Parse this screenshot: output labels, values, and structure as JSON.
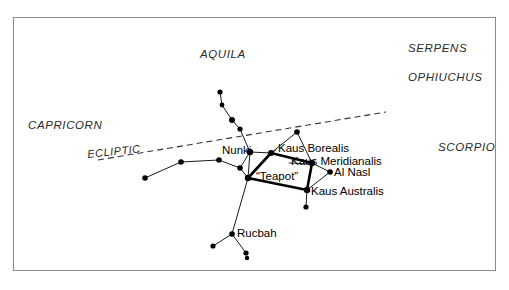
{
  "figure": {
    "background_color": "#ffffff",
    "border_color": "#8a8a8a"
  },
  "constellations": [
    {
      "name": "AQUILA",
      "x": 200,
      "y": 48
    },
    {
      "name": "SERPENS",
      "x": 408,
      "y": 42
    },
    {
      "name": "OPHIUCHUS",
      "x": 408,
      "y": 71
    },
    {
      "name": "CAPRICORN",
      "x": 28,
      "y": 119
    },
    {
      "name": "SCORPIO",
      "x": 438,
      "y": 141
    }
  ],
  "ecliptic": {
    "label": "ECLIPTIC",
    "label_x": 88,
    "label_y": 148,
    "line": {
      "x1": 98,
      "y1": 160,
      "x2": 386,
      "y2": 112
    },
    "style": "dashed",
    "color": "#333333"
  },
  "stars": [
    {
      "name": "chain-top",
      "x": 220,
      "y": 92,
      "r": 2.6
    },
    {
      "name": "chain-second",
      "x": 222,
      "y": 105,
      "r": 2.4
    },
    {
      "name": "chain-third",
      "x": 232,
      "y": 120,
      "r": 3.0
    },
    {
      "name": "chain-fourth",
      "x": 240,
      "y": 129,
      "r": 2.6
    },
    {
      "name": "nunki",
      "x": 250,
      "y": 152,
      "r": 3.2
    },
    {
      "name": "kaus-borealis",
      "x": 271,
      "y": 153,
      "r": 3.0
    },
    {
      "name": "upper-right-star",
      "x": 297,
      "y": 132,
      "r": 2.8
    },
    {
      "name": "kaus-meridianalis",
      "x": 312,
      "y": 163,
      "r": 3.2
    },
    {
      "name": "al-nasl",
      "x": 330,
      "y": 172,
      "r": 2.8
    },
    {
      "name": "kaus-australis",
      "x": 307,
      "y": 190,
      "r": 3.2
    },
    {
      "name": "below-australis",
      "x": 306,
      "y": 207,
      "r": 2.6
    },
    {
      "name": "teapot-west",
      "x": 248,
      "y": 178,
      "r": 3.2
    },
    {
      "name": "handle-star",
      "x": 240,
      "y": 168,
      "r": 2.8
    },
    {
      "name": "chain-left-a",
      "x": 219,
      "y": 160,
      "r": 2.8
    },
    {
      "name": "chain-left-b",
      "x": 181,
      "y": 162,
      "r": 2.8
    },
    {
      "name": "chain-left-end",
      "x": 145,
      "y": 178,
      "r": 2.8
    },
    {
      "name": "rucbah",
      "x": 232,
      "y": 234,
      "r": 2.8
    },
    {
      "name": "rucbah-left",
      "x": 213,
      "y": 246,
      "r": 2.6
    },
    {
      "name": "rucbah-down",
      "x": 246,
      "y": 253,
      "r": 2.6
    },
    {
      "name": "bottom-edge-star",
      "x": 247,
      "y": 258,
      "r": 2.2
    }
  ],
  "lines": [
    {
      "name": "chain-top-to-second",
      "x1": 220,
      "y1": 92,
      "x2": 222,
      "y2": 105
    },
    {
      "name": "chain-second-to-third",
      "x1": 222,
      "y1": 105,
      "x2": 232,
      "y2": 120
    },
    {
      "name": "chain-third-to-fourth",
      "x1": 232,
      "y1": 120,
      "x2": 240,
      "y2": 129
    },
    {
      "name": "chain-fourth-to-nunki",
      "x1": 240,
      "y1": 129,
      "x2": 250,
      "y2": 152
    },
    {
      "name": "nunki-to-teapot-west",
      "x1": 250,
      "y1": 152,
      "x2": 248,
      "y2": 178
    },
    {
      "name": "nunki-to-kaus-borealis",
      "x1": 250,
      "y1": 152,
      "x2": 271,
      "y2": 153
    },
    {
      "name": "borealis-to-upper-right",
      "x1": 271,
      "y1": 153,
      "x2": 297,
      "y2": 132
    },
    {
      "name": "upper-right-to-merid",
      "x1": 297,
      "y1": 132,
      "x2": 312,
      "y2": 163
    },
    {
      "name": "merid-to-al-nasl",
      "x1": 312,
      "y1": 163,
      "x2": 330,
      "y2": 172
    },
    {
      "name": "al-nasl-to-australis",
      "x1": 330,
      "y1": 172,
      "x2": 307,
      "y2": 190
    },
    {
      "name": "australis-to-below",
      "x1": 307,
      "y1": 190,
      "x2": 306,
      "y2": 207
    },
    {
      "name": "handle-to-teapot-west",
      "x1": 240,
      "y1": 168,
      "x2": 248,
      "y2": 178
    },
    {
      "name": "handle-to-nunki",
      "x1": 240,
      "y1": 168,
      "x2": 250,
      "y2": 152
    },
    {
      "name": "chain-a-to-handle",
      "x1": 219,
      "y1": 160,
      "x2": 240,
      "y2": 168
    },
    {
      "name": "chain-b-to-a",
      "x1": 181,
      "y1": 162,
      "x2": 219,
      "y2": 160
    },
    {
      "name": "chain-end-to-b",
      "x1": 145,
      "y1": 178,
      "x2": 181,
      "y2": 162
    },
    {
      "name": "teapot-west-to-rucbah",
      "x1": 248,
      "y1": 178,
      "x2": 232,
      "y2": 234
    },
    {
      "name": "rucbah-to-left",
      "x1": 232,
      "y1": 234,
      "x2": 213,
      "y2": 246
    },
    {
      "name": "rucbah-to-down",
      "x1": 232,
      "y1": 234,
      "x2": 246,
      "y2": 253
    }
  ],
  "teapot": {
    "label": "“Teapot”",
    "label_x": 256,
    "label_y": 170,
    "vertices": [
      {
        "x": 271,
        "y": 153
      },
      {
        "x": 312,
        "y": 163
      },
      {
        "x": 307,
        "y": 190
      },
      {
        "x": 248,
        "y": 178
      }
    ]
  },
  "star_labels": [
    {
      "name": "Nunki",
      "x": 222,
      "y": 144,
      "leader": null
    },
    {
      "name": "Kaus Borealis",
      "x": 278,
      "y": 142,
      "leader": {
        "x1": 276,
        "y1": 150,
        "x2": 271,
        "y2": 154
      }
    },
    {
      "name": "Kaus Meridianalis",
      "x": 291,
      "y": 155,
      "leader": {
        "x1": 289,
        "y1": 163,
        "x2": 312,
        "y2": 164
      }
    },
    {
      "name": "Al Nasl",
      "x": 334,
      "y": 166,
      "leader": {
        "x1": 332,
        "y1": 172,
        "x2": 330,
        "y2": 172
      }
    },
    {
      "name": "Kaus Australis",
      "x": 311,
      "y": 185,
      "leader": {
        "x1": 310,
        "y1": 191,
        "x2": 307,
        "y2": 190
      }
    },
    {
      "name": "Rucbah",
      "x": 237,
      "y": 227,
      "leader": null
    }
  ]
}
